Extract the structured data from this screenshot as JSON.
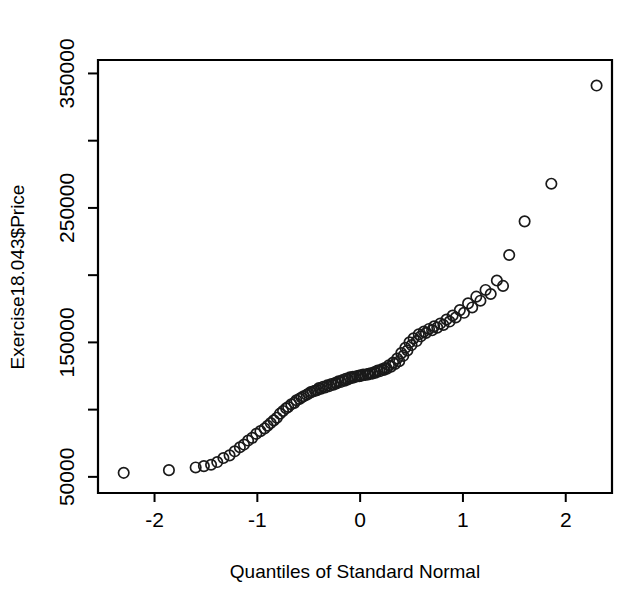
{
  "chart_data": {
    "type": "scatter",
    "title": "",
    "subtitle": "",
    "xlabel": "Quantiles of Standard Normal",
    "ylabel": "Exercise18.043$Price",
    "xlim": [
      -2.55,
      2.45
    ],
    "ylim": [
      38000,
      360000
    ],
    "grid": false,
    "legend": null,
    "annotations": [],
    "marker": "open-circle",
    "xticks": [
      -2,
      -1,
      0,
      1,
      2
    ],
    "xticklabels": [
      "-2",
      "-1",
      "0",
      "1",
      "2"
    ],
    "yticks": [
      50000,
      150000,
      250000,
      350000
    ],
    "yticklabels": [
      "50000",
      "150000",
      "250000",
      "350000"
    ],
    "y_minor_ticks": [
      100000,
      200000,
      300000
    ],
    "series": [
      {
        "name": "Price quantiles",
        "x": [
          -2.3,
          -1.86,
          -1.6,
          -1.45,
          -1.33,
          -1.22,
          -1.13,
          -1.05,
          -0.97,
          -0.9,
          -0.84,
          -0.78,
          -0.72,
          -0.67,
          -0.62,
          -0.57,
          -0.52,
          -0.48,
          -0.44,
          -0.4,
          -0.36,
          -0.32,
          -0.28,
          -0.24,
          -0.21,
          -0.17,
          -0.14,
          -0.1,
          -0.07,
          -0.03,
          0.0,
          0.03,
          0.07,
          0.1,
          0.14,
          0.17,
          0.21,
          0.24,
          0.28,
          0.32,
          0.36,
          0.4,
          0.44,
          0.48,
          0.52,
          0.57,
          0.62,
          0.67,
          0.72,
          0.78,
          0.84,
          0.9,
          0.97,
          1.05,
          1.13,
          1.22,
          1.33,
          1.45,
          1.6,
          1.86,
          2.3,
          -1.52,
          -1.39,
          -1.27,
          -1.17,
          -1.09,
          -1.01,
          -0.93,
          -0.87,
          -0.81,
          -0.75,
          -0.7,
          -0.64,
          -0.59,
          -0.55,
          -0.5,
          -0.46,
          -0.42,
          -0.38,
          -0.34,
          -0.3,
          -0.26,
          -0.23,
          -0.19,
          -0.15,
          -0.12,
          -0.08,
          -0.05,
          -0.01,
          0.01,
          0.05,
          0.08,
          0.12,
          0.15,
          0.19,
          0.23,
          0.26,
          0.3,
          0.34,
          0.38,
          0.42,
          0.46,
          0.5,
          0.55,
          0.59,
          0.64,
          0.7,
          0.75,
          0.81,
          0.87,
          0.93,
          1.01,
          1.09,
          1.17,
          1.27,
          1.39
        ],
        "y": [
          53000,
          55000,
          57000,
          59000,
          64000,
          69000,
          74000,
          79000,
          84000,
          88000,
          92000,
          97000,
          101000,
          104000,
          107000,
          109000,
          111000,
          113000,
          114000,
          116000,
          117000,
          118000,
          119000,
          120000,
          121000,
          122000,
          123000,
          124000,
          124500,
          125000,
          125500,
          126000,
          126500,
          127000,
          128000,
          129000,
          130000,
          131000,
          133000,
          135000,
          138000,
          142000,
          146000,
          150000,
          153000,
          156000,
          158000,
          160000,
          162000,
          164000,
          167000,
          170000,
          174000,
          179000,
          184000,
          189000,
          196000,
          215000,
          240000,
          268000,
          341000,
          58000,
          61000,
          66000,
          72000,
          77000,
          82000,
          86000,
          90000,
          94000,
          99000,
          102000,
          105000,
          108000,
          110000,
          112000,
          113500,
          114500,
          115500,
          116500,
          117500,
          118500,
          119500,
          120500,
          121500,
          122500,
          123500,
          124200,
          124800,
          125200,
          125800,
          126200,
          126800,
          127500,
          128500,
          129500,
          130500,
          132000,
          134000,
          136000,
          140000,
          144000,
          148000,
          151000,
          154500,
          157000,
          159000,
          161000,
          163000,
          165500,
          168500,
          172000,
          176000,
          181000,
          186000,
          192000
        ]
      }
    ]
  },
  "axes": {
    "x_title": "Quantiles of Standard Normal",
    "y_title": "Exercise18.043$Price"
  }
}
